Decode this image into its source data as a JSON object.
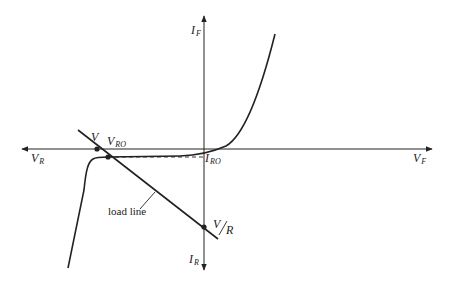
{
  "diagram": {
    "type": "diode I-V characteristic with load line",
    "axes": {
      "forward_current": {
        "symbol": "I",
        "sub": "F"
      },
      "reverse_current": {
        "symbol": "I",
        "sub": "R"
      },
      "forward_voltage": {
        "symbol": "V",
        "sub": "F"
      },
      "reverse_voltage": {
        "symbol": "V",
        "sub": "R"
      }
    },
    "points": {
      "source_voltage": {
        "symbol": "V",
        "sub": ""
      },
      "operating_voltage": {
        "symbol": "V",
        "sub": "RO"
      },
      "operating_current": {
        "symbol": "I",
        "sub": "RO"
      },
      "intercept": {
        "num": "V",
        "den": "R"
      }
    },
    "annotations": {
      "load_line": "load line"
    },
    "colors": {
      "line": "#222222",
      "background": "#ffffff"
    }
  }
}
